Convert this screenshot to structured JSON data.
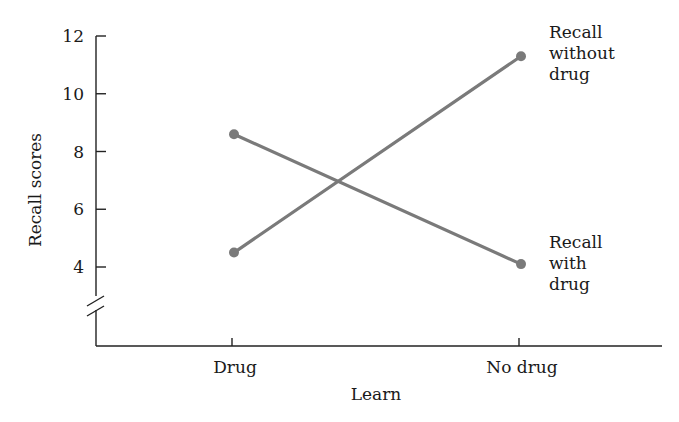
{
  "chart_data": {
    "type": "line",
    "title": "",
    "xlabel": "Learn",
    "ylabel": "Recall scores",
    "categories": [
      "Drug",
      "No drug"
    ],
    "y_ticks": [
      4,
      6,
      8,
      10,
      12
    ],
    "ylim": [
      4,
      12
    ],
    "axis_break": true,
    "grid": false,
    "series": [
      {
        "name": "Recall with drug",
        "label_lines": [
          "Recall",
          "with",
          "drug"
        ],
        "values": [
          8.6,
          4.1
        ]
      },
      {
        "name": "Recall without drug",
        "label_lines": [
          "Recall",
          "without",
          "drug"
        ],
        "values": [
          4.5,
          11.3
        ]
      }
    ],
    "legend": "direct-labels-right",
    "colors": {
      "series": "#7a7a7a",
      "axis": "#222222"
    }
  }
}
